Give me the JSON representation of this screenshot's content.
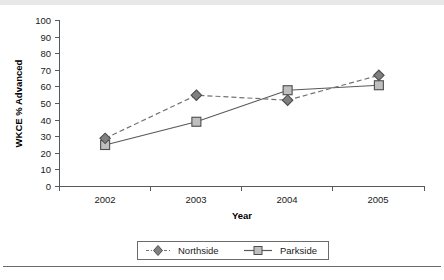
{
  "chart_data": {
    "type": "line",
    "title": "",
    "xlabel": "Year",
    "ylabel": "WKCE % Advanced",
    "categories": [
      "2002",
      "2003",
      "2004",
      "2005"
    ],
    "ylim": [
      0,
      100
    ],
    "ytick_step": 10,
    "yticks": [
      "0",
      "10",
      "20",
      "30",
      "40",
      "50",
      "60",
      "70",
      "80",
      "90",
      "100"
    ],
    "grid": false,
    "legend_position": "bottom-center",
    "series": [
      {
        "name": "Northside",
        "values": [
          29,
          55,
          52,
          67
        ],
        "line_style": "dashed",
        "marker": "diamond",
        "marker_fill": "#808080",
        "marker_stroke": "#4d4d4d",
        "line_color": "#737373"
      },
      {
        "name": "Parkside",
        "values": [
          25,
          39,
          58,
          61
        ],
        "line_style": "solid",
        "marker": "square",
        "marker_fill": "#bfbfbf",
        "marker_stroke": "#4d4d4d",
        "line_color": "#595959"
      }
    ]
  },
  "axes": {
    "y_title": "WKCE % Advanced",
    "x_title": "Year",
    "y_tick_0": "0",
    "y_tick_1": "10",
    "y_tick_2": "20",
    "y_tick_3": "30",
    "y_tick_4": "40",
    "y_tick_5": "50",
    "y_tick_6": "60",
    "y_tick_7": "70",
    "y_tick_8": "80",
    "y_tick_9": "90",
    "y_tick_10": "100",
    "x_tick_0": "2002",
    "x_tick_1": "2003",
    "x_tick_2": "2004",
    "x_tick_3": "2005"
  },
  "legend": {
    "entry_0": "Northside",
    "entry_1": "Parkside"
  },
  "footer": {
    "ghost_text": ""
  },
  "colors": {
    "axis": "#595959",
    "text": "#1a1a1a",
    "northside_marker": "#808080",
    "parkside_marker": "#bfbfbf",
    "marker_outline": "#4d4d4d",
    "background": "#ffffff",
    "rule": "#6b6b6b"
  }
}
